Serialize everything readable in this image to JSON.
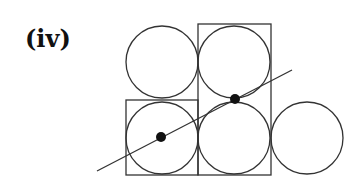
{
  "label": "(iv)",
  "colors": {
    "stroke": "#333333",
    "dot": "#111111",
    "background": "#ffffff"
  },
  "diagram": {
    "circles": [
      {
        "name": "top-left",
        "cx": 162,
        "cy": 62,
        "r": 36
      },
      {
        "name": "top-middle",
        "cx": 234,
        "cy": 62,
        "r": 36
      },
      {
        "name": "bottom-left",
        "cx": 162,
        "cy": 138,
        "r": 36
      },
      {
        "name": "bottom-middle",
        "cx": 234,
        "cy": 138,
        "r": 36
      },
      {
        "name": "right",
        "cx": 307,
        "cy": 138,
        "r": 36
      }
    ],
    "rectangles": [
      {
        "name": "left-box",
        "x": 126,
        "y": 100,
        "w": 72,
        "h": 75
      },
      {
        "name": "middle-box",
        "x": 198,
        "y": 24,
        "w": 73,
        "h": 151
      }
    ],
    "line": {
      "x1": 97,
      "y1": 171,
      "x2": 292,
      "y2": 70
    },
    "dots": [
      {
        "name": "left-dot",
        "cx": 161,
        "cy": 137,
        "r": 5
      },
      {
        "name": "middle-dot",
        "cx": 235,
        "cy": 99,
        "r": 5
      }
    ]
  }
}
